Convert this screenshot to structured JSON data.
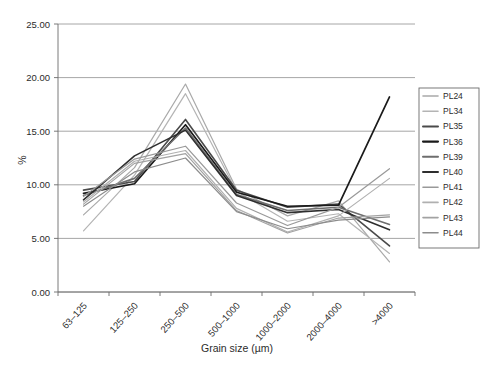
{
  "chart_data": {
    "type": "line",
    "title": "",
    "xlabel": "Grain size (µm)",
    "ylabel": "%",
    "categories": [
      "63–125",
      "125–250",
      "250–500",
      "500–1000",
      "1000–2000",
      "2000–4000",
      ">4000"
    ],
    "ylim": [
      0,
      25
    ],
    "ytick_step": 5,
    "ytick_labels": [
      "0.00",
      "5.00",
      "10.00",
      "15.00",
      "20.00",
      "25.00"
    ],
    "ytick_values": [
      0,
      5,
      10,
      15,
      20,
      25
    ],
    "grid": true,
    "legend_position": "right",
    "series": [
      {
        "name": "PL24",
        "color": "#a9a9a9",
        "width": 1.2,
        "values": [
          7.2,
          11.6,
          19.4,
          9.6,
          7.1,
          8.5,
          2.8
        ]
      },
      {
        "name": "PL34",
        "color": "#b4b4b4",
        "width": 1.2,
        "values": [
          5.7,
          10.9,
          18.5,
          9.4,
          6.6,
          7.3,
          3.6
        ]
      },
      {
        "name": "PL35",
        "color": "#4a4a4a",
        "width": 1.6,
        "values": [
          9.5,
          10.3,
          16.1,
          9.5,
          7.9,
          8.2,
          4.3
        ]
      },
      {
        "name": "PL36",
        "color": "#1a1a1a",
        "width": 1.7,
        "values": [
          9.2,
          10.1,
          15.6,
          9.3,
          8.0,
          8.1,
          18.2
        ]
      },
      {
        "name": "PL39",
        "color": "#6e6e6e",
        "width": 1.6,
        "values": [
          9.0,
          10.6,
          15.3,
          9.1,
          7.6,
          7.9,
          6.3
        ]
      },
      {
        "name": "PL40",
        "color": "#2e2e2e",
        "width": 1.6,
        "values": [
          8.6,
          12.7,
          15.1,
          9.0,
          7.4,
          7.7,
          5.8
        ]
      },
      {
        "name": "PL41",
        "color": "#999999",
        "width": 1.2,
        "values": [
          8.9,
          12.4,
          13.6,
          8.3,
          6.2,
          7.9,
          11.5
        ]
      },
      {
        "name": "PL42",
        "color": "#b0b0b0",
        "width": 1.2,
        "values": [
          8.4,
          12.2,
          13.2,
          7.8,
          5.6,
          7.1,
          10.6
        ]
      },
      {
        "name": "PL43",
        "color": "#a2a2a2",
        "width": 1.2,
        "values": [
          8.2,
          12.0,
          12.9,
          7.6,
          5.5,
          6.9,
          7.2
        ]
      },
      {
        "name": "PL44",
        "color": "#8c8c8c",
        "width": 1.2,
        "values": [
          8.0,
          11.2,
          12.5,
          7.5,
          5.9,
          6.7,
          7.0
        ]
      }
    ]
  }
}
